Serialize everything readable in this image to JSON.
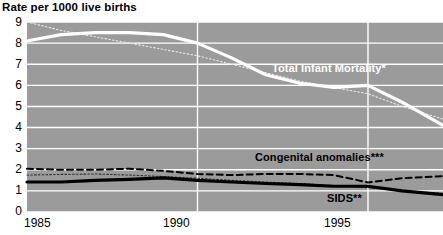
{
  "chart_data": {
    "type": "line",
    "title": "Rate per 1000 live births",
    "xlabel": "",
    "ylabel": "",
    "xlim": [
      1985,
      1997.2
    ],
    "ylim": [
      0,
      9
    ],
    "yticks": [
      0,
      1,
      2,
      3,
      4,
      5,
      6,
      7,
      8,
      9
    ],
    "ytick_labels": [
      "0",
      "1",
      "2",
      "3",
      "4",
      "5",
      "6",
      "7",
      "8",
      "9"
    ],
    "xticks": [
      1985,
      1990,
      1995
    ],
    "xtick_labels": [
      "1985",
      "1990",
      "1995"
    ],
    "grid": "horizontal gridlines at every integer y value plus vertical gridlines at 1990 and 1995, drawn in white on a gray plot background",
    "legend_position": "inline labels on plot",
    "plot_background": "#9b9b9b",
    "figure_background": "#ffffff",
    "series": [
      {
        "name": "Total Infant Mortality*",
        "style": "solid",
        "color": "#ffffff",
        "width": "thick",
        "label_text": "Total Infant Mortality*",
        "label_color": "#ffffff",
        "x": [
          1985,
          1986,
          1987,
          1988,
          1989,
          1990,
          1991,
          1992,
          1993,
          1994,
          1995,
          1996,
          1997.2
        ],
        "values": [
          8.1,
          8.4,
          8.5,
          8.5,
          8.4,
          8.0,
          7.3,
          6.5,
          6.1,
          5.9,
          6.0,
          5.2,
          4.1
        ]
      },
      {
        "name": "Total Infant Mortality (dotted trace)",
        "style": "dotted",
        "color": "#e8e8e8",
        "width": "thin",
        "x": [
          1985,
          1986,
          1987,
          1988,
          1989,
          1990,
          1991,
          1992,
          1993,
          1994,
          1995,
          1996,
          1997.2
        ],
        "values": [
          9.0,
          8.6,
          8.3,
          8.0,
          7.7,
          7.4,
          7.0,
          6.6,
          6.2,
          5.9,
          5.6,
          5.0,
          4.4
        ]
      },
      {
        "name": "Congenital anomalies***",
        "style": "dashed",
        "color": "#000000",
        "width": "medium",
        "label_text": "Congenital anomalies***",
        "label_color": "#000000",
        "x": [
          1985,
          1986,
          1987,
          1988,
          1989,
          1990,
          1991,
          1992,
          1993,
          1994,
          1995,
          1996,
          1997.2
        ],
        "values": [
          2.05,
          2.0,
          2.0,
          2.05,
          1.95,
          1.8,
          1.75,
          1.8,
          1.8,
          1.75,
          1.4,
          1.6,
          1.7
        ]
      },
      {
        "name": "SIDS**",
        "style": "solid",
        "color": "#000000",
        "width": "thick",
        "label_text": "SIDS**",
        "label_color": "#000000",
        "x": [
          1985,
          1986,
          1987,
          1988,
          1989,
          1990,
          1991,
          1992,
          1993,
          1994,
          1995,
          1996,
          1997.2
        ],
        "values": [
          1.42,
          1.42,
          1.5,
          1.55,
          1.62,
          1.5,
          1.42,
          1.35,
          1.3,
          1.22,
          1.22,
          1.0,
          0.82
        ]
      },
      {
        "name": "SIDS (dotted trace)",
        "style": "dotted",
        "color": "#303030",
        "width": "thin",
        "x": [
          1985,
          1986,
          1987,
          1988,
          1989,
          1990,
          1991,
          1992,
          1993,
          1994,
          1995,
          1996,
          1997.2
        ],
        "values": [
          1.75,
          1.78,
          1.8,
          1.75,
          1.68,
          1.6,
          1.5,
          1.42,
          1.35,
          1.25,
          1.15,
          1.0,
          0.88
        ]
      }
    ]
  },
  "labels": {
    "title": "Rate per 1000 live births",
    "total_infant_mortality": "Total Infant Mortality*",
    "congenital_anomalies": "Congenital anomalies***",
    "sids": "SIDS**",
    "y_0": "0",
    "y_1": "1",
    "y_2": "2",
    "y_3": "3",
    "y_4": "4",
    "y_5": "5",
    "y_6": "6",
    "y_7": "7",
    "y_8": "8",
    "y_9": "9",
    "x_1985": "1985",
    "x_1990": "1990",
    "x_1995": "1995"
  }
}
